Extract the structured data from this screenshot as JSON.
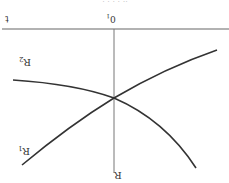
{
  "figure": {
    "orientation": "rotated-180",
    "colors": {
      "axis": "#666666",
      "curve": "#333333",
      "background": "#ffffff"
    },
    "axes": {
      "horizontal_label": "t",
      "origin_label": "0",
      "origin_subscript": "1",
      "vertical_label": "R"
    },
    "curves": [
      {
        "name": "R1",
        "label": "R",
        "subscript": "1",
        "description": "increasing curve (as displayed)"
      },
      {
        "name": "R2",
        "label": "R",
        "subscript": "2",
        "description": "decreasing curve (as displayed)"
      }
    ],
    "intersection": {
      "description": "R1 and R2 cross on the vertical axis"
    },
    "top_cut_text": "· · · ·      ··"
  }
}
